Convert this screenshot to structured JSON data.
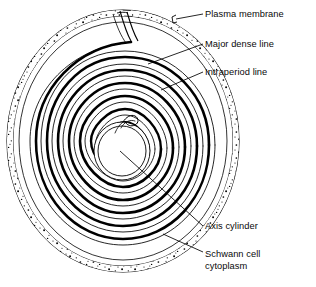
{
  "figure": {
    "colors": {
      "ink": "#000000",
      "background": "#ffffff",
      "major_dense_line": "#000000",
      "intraperiod_line": "#000000",
      "stipple": "#000000"
    }
  },
  "labels": [
    {
      "id": "plasma-membrane",
      "text": "Plasma membrane",
      "lines": [
        "Plasma membrane"
      ],
      "x": 205,
      "y": 9,
      "leader": {
        "x1": 203,
        "y1": 14,
        "x2": 172,
        "y2": 19
      }
    },
    {
      "id": "major-dense-line",
      "text": "Major dense line",
      "lines": [
        "Major dense line"
      ],
      "x": 205,
      "y": 39,
      "leader": {
        "x1": 203,
        "y1": 44,
        "x2": 148,
        "y2": 64
      }
    },
    {
      "id": "intraperiod-line",
      "text": "Intraperiod line",
      "lines": [
        "Intraperiod line"
      ],
      "x": 205,
      "y": 67,
      "leader": {
        "x1": 203,
        "y1": 72,
        "x2": 161,
        "y2": 90
      }
    },
    {
      "id": "axis-cylinder",
      "text": "Axis cylinder",
      "lines": [
        "Axis cylinder"
      ],
      "x": 205,
      "y": 221,
      "leader": {
        "x1": 203,
        "y1": 226,
        "x2": 120,
        "y2": 151
      }
    },
    {
      "id": "schwann-cell-cytoplasm",
      "text": "Schwann cell cytoplasm",
      "lines": [
        "Schwann cell",
        "cytoplasm"
      ],
      "x": 205,
      "y": 252,
      "leader": {
        "x1": 203,
        "y1": 252,
        "x2": 163,
        "y2": 234
      }
    }
  ],
  "structures": [
    {
      "id": "outer-plasma-membrane",
      "name": "Outer plasma membrane (Schwann cell surface)"
    },
    {
      "id": "schwann-cytoplasm-band",
      "name": "Stippled Schwann cell cytoplasm band"
    },
    {
      "id": "outer-mesaxon",
      "name": "Outer mesaxon notch at top"
    },
    {
      "id": "myelin-spiral",
      "name": "Compacted myelin spiral lamellae"
    },
    {
      "id": "axis-cylinder-core",
      "name": "Central axis cylinder (axon)"
    },
    {
      "id": "inner-mesaxon",
      "name": "Inner mesaxon hook at spiral terminus"
    }
  ]
}
